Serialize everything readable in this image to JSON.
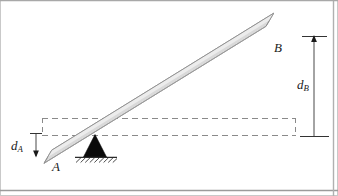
{
  "figure": {
    "canvas": {
      "width": 338,
      "height": 196,
      "background": "#ffffff"
    },
    "border_color": "#b6b6b6",
    "labels": {
      "point_a": "A",
      "point_b": "B",
      "dim_a_main": "d",
      "dim_a_sub": "A",
      "dim_b_main": "d",
      "dim_b_sub": "B"
    },
    "colors": {
      "beam_fill": "#d9d9d9",
      "beam_stroke": "#8c8c8c",
      "beam_highlight": "#efefef",
      "pivot_fill": "#000000",
      "ground_line": "#2b2b2b",
      "dashed_line": "#8a8a8a",
      "dimension_line": "#333333",
      "text": "#1a1a1a"
    },
    "geometry": {
      "beam": {
        "a_end_x": 44,
        "a_end_y": 156,
        "b_end_x": 266,
        "b_end_y": 19,
        "thickness": 13
      },
      "pivot": {
        "apex_x": 95,
        "apex_y": 138,
        "base_left_x": 83,
        "base_right_x": 107,
        "base_y": 157
      },
      "ground": {
        "x1": 76,
        "x2": 116,
        "y": 157,
        "hatch_count": 9
      },
      "dashed_box": {
        "left": 42,
        "top": 118,
        "right": 296,
        "bottom": 135
      },
      "dim_a": {
        "x": 36,
        "top_y": 133,
        "bottom_y": 157
      },
      "dim_b": {
        "x": 314,
        "top_y": 36,
        "bottom_y": 136,
        "tick_half_width": 12
      }
    }
  }
}
